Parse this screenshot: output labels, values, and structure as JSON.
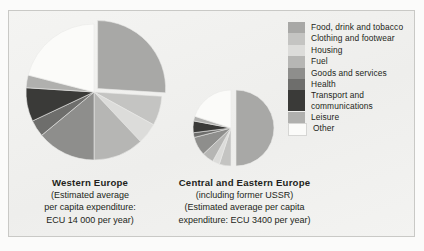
{
  "figure": {
    "background_color": "#f1f1ef",
    "frame_color": "#c9c9c6"
  },
  "legend": {
    "position": "right",
    "items": [
      {
        "label": "Food, drink and tobacco",
        "color": "#a8a8a6"
      },
      {
        "label": "Clothing and footwear",
        "color": "#c4c4c2"
      },
      {
        "label": "Housing",
        "color": "#dcdcda"
      },
      {
        "label": "Fuel",
        "color": "#b6b6b4"
      },
      {
        "label": "Goods and services",
        "color": "#8e8e8c"
      },
      {
        "label": "Health",
        "color": "#6e6e6c"
      },
      {
        "label": "Transport and communications",
        "color": "#3a3a38"
      },
      {
        "label": "Leisure",
        "color": "#b0b0ae"
      },
      {
        "label": "Other",
        "color": "#fbfbf9"
      }
    ]
  },
  "captions": {
    "west": {
      "title": "Western Europe",
      "line1": "(Estimated average",
      "line2": "per capita expenditure:",
      "line3": "ECU 14 000  per year)"
    },
    "east": {
      "title": "Central and Eastern Europe",
      "line1": "(including former USSR)",
      "line2": "(Estimated average per capita",
      "line3": "expenditure: ECU 3400 per year)"
    }
  },
  "chart_data": {
    "type": "pie",
    "title": "",
    "categories": [
      "Food, drink and tobacco",
      "Clothing and footwear",
      "Housing",
      "Fuel",
      "Goods and services",
      "Health",
      "Transport and communications",
      "Leisure",
      "Other"
    ],
    "colors": [
      "#a8a8a6",
      "#c4c4c2",
      "#dcdcda",
      "#b6b6b4",
      "#8e8e8c",
      "#6e6e6c",
      "#3a3a38",
      "#b0b0ae",
      "#fbfbf9"
    ],
    "charts": [
      {
        "name": "Western Europe",
        "note": "Estimated average per capita expenditure: ECU 14 000 per year",
        "radius_px": 68,
        "exploded_slice": "Food, drink and tobacco",
        "values": [
          26,
          7,
          5,
          12,
          14,
          4,
          8,
          3,
          21
        ],
        "unit": "percent"
      },
      {
        "name": "Central and Eastern Europe",
        "note": "including former USSR; Estimated average per capita expenditure: ECU 3400 per year",
        "radius_px": 38,
        "exploded_slice": "Food, drink and tobacco",
        "values": [
          50,
          5,
          3,
          5,
          8,
          2,
          5,
          2,
          20
        ],
        "unit": "percent"
      }
    ],
    "legend_position": "right",
    "grid": false
  }
}
